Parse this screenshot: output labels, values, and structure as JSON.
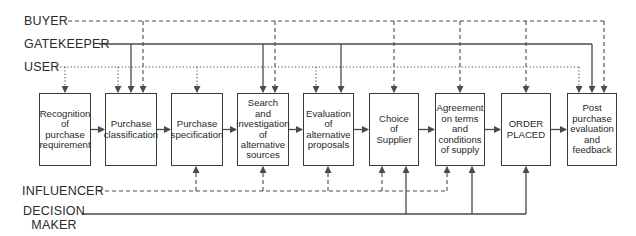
{
  "diagram": {
    "type": "flow",
    "title": "",
    "colors": {
      "line": "#4a4a4a",
      "text": "#2a2a2a",
      "box_border": "#3a3a3a",
      "background": "#ffffff"
    },
    "roles": [
      {
        "id": "buyer",
        "label": "BUYER",
        "style": "dashed",
        "side": "top",
        "y": 21,
        "label_x": 24,
        "line_start_x": 68
      },
      {
        "id": "gatekeeper",
        "label": "GATEKEEPER",
        "style": "solid",
        "side": "top",
        "y": 44,
        "label_x": 24,
        "line_start_x": 99
      },
      {
        "id": "user",
        "label": "USER",
        "style": "dotted",
        "side": "top",
        "y": 67,
        "label_x": 24,
        "line_start_x": 57
      },
      {
        "id": "influencer",
        "label": "INFLUENCER",
        "style": "dashed",
        "side": "bottom",
        "y": 191,
        "label_x": 22,
        "line_start_x": 98
      },
      {
        "id": "decision_maker",
        "label": "DECISION MAKER",
        "label_lines": [
          "DECISION",
          "MAKER"
        ],
        "style": "solid",
        "side": "bottom",
        "y": 214,
        "label_x": 23,
        "line_start_x": 82
      }
    ],
    "stages": [
      {
        "id": "s1",
        "label": "Recognition of purchase requirement",
        "lines": [
          "Recognition",
          "of",
          "purchase",
          "requirement"
        ],
        "x": 39,
        "w": 52
      },
      {
        "id": "s2",
        "label": "Purchase classification",
        "lines": [
          "Purchase",
          "classification"
        ],
        "x": 105,
        "w": 52
      },
      {
        "id": "s3",
        "label": "Purchase specification",
        "lines": [
          "Purchase",
          "specification"
        ],
        "x": 171,
        "w": 52
      },
      {
        "id": "s4",
        "label": "Search and investigation of alternative sources",
        "lines": [
          "Search",
          "and",
          "investigation",
          "of",
          "alternative",
          "sources"
        ],
        "x": 237,
        "w": 52
      },
      {
        "id": "s5",
        "label": "Evaluation of alternative proposals",
        "lines": [
          "Evaluation",
          "of",
          "alternative",
          "proposals"
        ],
        "x": 303,
        "w": 51
      },
      {
        "id": "s6",
        "label": "Choice of Supplier",
        "lines": [
          "Choice",
          "of",
          "Supplier"
        ],
        "x": 369,
        "w": 50
      },
      {
        "id": "s7",
        "label": "Agreement on terms and conditions of supply",
        "lines": [
          "Agreement",
          "on terms",
          "and",
          "conditions",
          "of supply"
        ],
        "x": 435,
        "w": 50
      },
      {
        "id": "s8",
        "label": "ORDER PLACED",
        "lines": [
          "ORDER",
          "PLACED"
        ],
        "x": 501,
        "w": 50
      },
      {
        "id": "s9",
        "label": "Post purchase evaluation and feedback",
        "lines": [
          "Post",
          "purchase",
          "evaluation",
          "and",
          "feedback"
        ],
        "x": 567,
        "w": 50
      }
    ],
    "box_top": 93,
    "box_bottom": 166,
    "connections": [
      {
        "role": "user",
        "stage": "s1",
        "x": 65
      },
      {
        "role": "user",
        "stage": "s2",
        "x": 118
      },
      {
        "role": "gatekeeper",
        "stage": "s2",
        "x": 131
      },
      {
        "role": "buyer",
        "stage": "s2",
        "x": 143
      },
      {
        "role": "user",
        "stage": "s3",
        "x": 197
      },
      {
        "role": "gatekeeper",
        "stage": "s4",
        "x": 263
      },
      {
        "role": "buyer",
        "stage": "s4",
        "x": 275
      },
      {
        "role": "user",
        "stage": "s5",
        "x": 316
      },
      {
        "role": "gatekeeper",
        "stage": "s5",
        "x": 341
      },
      {
        "role": "buyer",
        "stage": "s6",
        "x": 394
      },
      {
        "role": "buyer",
        "stage": "s7",
        "x": 460
      },
      {
        "role": "buyer",
        "stage": "s8",
        "x": 526
      },
      {
        "role": "user",
        "stage": "s9",
        "x": 579
      },
      {
        "role": "gatekeeper",
        "stage": "s9",
        "x": 592
      },
      {
        "role": "buyer",
        "stage": "s9",
        "x": 604
      },
      {
        "role": "influencer",
        "stage": "s3",
        "x": 196
      },
      {
        "role": "influencer",
        "stage": "s4",
        "x": 263
      },
      {
        "role": "influencer",
        "stage": "s5",
        "x": 328
      },
      {
        "role": "influencer",
        "stage": "s6",
        "x": 382
      },
      {
        "role": "influencer",
        "stage": "s7",
        "x": 447
      },
      {
        "role": "decision_maker",
        "stage": "s6",
        "x": 406
      },
      {
        "role": "decision_maker",
        "stage": "s7",
        "x": 472
      },
      {
        "role": "decision_maker",
        "stage": "s8",
        "x": 526
      }
    ]
  }
}
